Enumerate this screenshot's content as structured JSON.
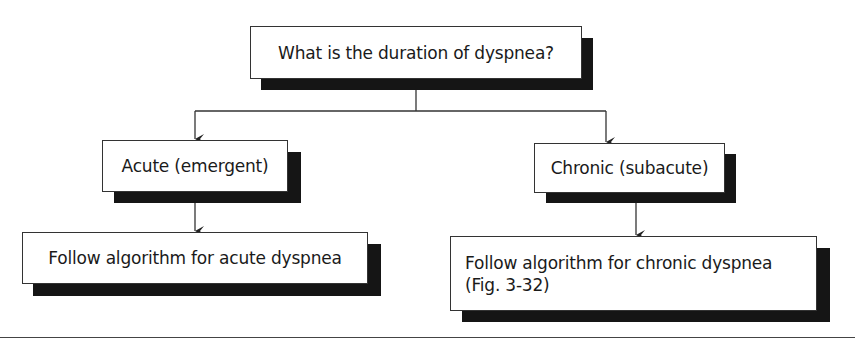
{
  "diagram": {
    "type": "flowchart",
    "question": {
      "id": "q1",
      "label": "What is the duration of dyspnea?"
    },
    "branches": [
      {
        "id": "acute",
        "label": "Acute (emergent)",
        "next": {
          "id": "acute-action",
          "label": "Follow algorithm for acute dyspnea"
        }
      },
      {
        "id": "chronic",
        "label": "Chronic (subacute)",
        "next": {
          "id": "chronic-action",
          "label": "Follow algorithm for chronic dyspnea\n(Fig. 3-32)"
        }
      }
    ],
    "edges": [
      {
        "from": "q1",
        "to": "acute"
      },
      {
        "from": "q1",
        "to": "chronic"
      },
      {
        "from": "acute",
        "to": "acute-action"
      },
      {
        "from": "chronic",
        "to": "chronic-action"
      }
    ],
    "colors": {
      "box_fill": "#ffffff",
      "box_border": "#333333",
      "shadow": "#151515",
      "line": "#333333"
    }
  }
}
